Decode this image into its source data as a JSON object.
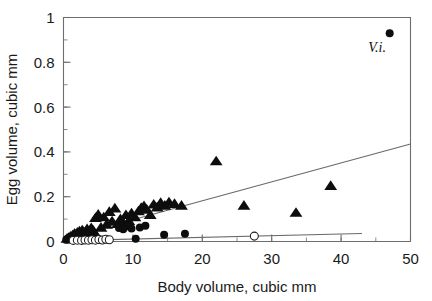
{
  "chart_data": {
    "type": "scatter",
    "title": "",
    "xlabel": "Body volume, cubic mm",
    "ylabel": "Egg volume, cubic mm",
    "xlim": [
      0,
      50
    ],
    "ylim": [
      0,
      1
    ],
    "xticks": [
      0,
      10,
      20,
      30,
      40,
      50
    ],
    "xtick_labels": [
      "0",
      "10",
      "20",
      "30",
      "40",
      "50"
    ],
    "xminor_step": 5,
    "yticks": [
      0,
      0.2,
      0.4,
      0.6,
      0.8,
      1
    ],
    "ytick_labels": [
      "0",
      "0.2",
      "0.4",
      "0.6",
      "0.8",
      "1"
    ],
    "yminor_step": 0.1,
    "grid": false,
    "legend": "none",
    "annotations": [
      {
        "text": "V.i.",
        "x": 45.2,
        "y": 0.845,
        "style": "italic-serif"
      }
    ],
    "series": [
      {
        "name": "filled-triangles",
        "marker": "filled-triangle",
        "color": "#0d0d0d",
        "points": [
          [
            0.5,
            0.012
          ],
          [
            0.7,
            0.016
          ],
          [
            0.9,
            0.01
          ],
          [
            1.0,
            0.022
          ],
          [
            1.1,
            0.014
          ],
          [
            1.3,
            0.028
          ],
          [
            1.5,
            0.02
          ],
          [
            1.6,
            0.035
          ],
          [
            1.8,
            0.026
          ],
          [
            2.0,
            0.04
          ],
          [
            2.1,
            0.03
          ],
          [
            2.3,
            0.045
          ],
          [
            2.5,
            0.034
          ],
          [
            2.7,
            0.05
          ],
          [
            2.9,
            0.042
          ],
          [
            3.1,
            0.03
          ],
          [
            3.4,
            0.055
          ],
          [
            3.7,
            0.044
          ],
          [
            4.0,
            0.06
          ],
          [
            4.3,
            0.048
          ],
          [
            4.6,
            0.105
          ],
          [
            5.0,
            0.12
          ],
          [
            5.4,
            0.062
          ],
          [
            5.8,
            0.108
          ],
          [
            6.2,
            0.075
          ],
          [
            6.6,
            0.132
          ],
          [
            7.0,
            0.09
          ],
          [
            7.4,
            0.148
          ],
          [
            7.8,
            0.078
          ],
          [
            8.2,
            0.1
          ],
          [
            8.6,
            0.084
          ],
          [
            9.0,
            0.118
          ],
          [
            9.4,
            0.092
          ],
          [
            9.8,
            0.126
          ],
          [
            10.3,
            0.108
          ],
          [
            10.8,
            0.135
          ],
          [
            11.2,
            0.15
          ],
          [
            11.6,
            0.158
          ],
          [
            12.0,
            0.142
          ],
          [
            12.5,
            0.118
          ],
          [
            13.0,
            0.165
          ],
          [
            13.5,
            0.152
          ],
          [
            14.0,
            0.172
          ],
          [
            14.6,
            0.16
          ],
          [
            15.2,
            0.175
          ],
          [
            16.0,
            0.168
          ],
          [
            17.0,
            0.16
          ],
          [
            22.0,
            0.358
          ],
          [
            26.0,
            0.16
          ],
          [
            33.5,
            0.128
          ],
          [
            38.5,
            0.248
          ]
        ]
      },
      {
        "name": "filled-circles",
        "marker": "filled-circle",
        "color": "#0d0d0d",
        "points": [
          [
            0.4,
            0.008
          ],
          [
            0.6,
            0.013
          ],
          [
            0.8,
            0.009
          ],
          [
            1.0,
            0.018
          ],
          [
            1.2,
            0.011
          ],
          [
            1.4,
            0.024
          ],
          [
            1.7,
            0.015
          ],
          [
            1.9,
            0.03
          ],
          [
            2.2,
            0.02
          ],
          [
            2.5,
            0.014
          ],
          [
            2.8,
            0.026
          ],
          [
            3.2,
            0.018
          ],
          [
            3.6,
            0.012
          ],
          [
            4.1,
            0.022
          ],
          [
            4.8,
            0.016
          ],
          [
            8.0,
            0.06
          ],
          [
            8.6,
            0.055
          ],
          [
            9.2,
            0.068
          ],
          [
            9.8,
            0.058
          ],
          [
            10.4,
            0.012
          ],
          [
            11.0,
            0.062
          ],
          [
            11.8,
            0.07
          ],
          [
            14.5,
            0.03
          ],
          [
            17.5,
            0.035
          ],
          [
            47.0,
            0.93
          ]
        ]
      },
      {
        "name": "open-circles",
        "marker": "open-circle",
        "color": "#ffffff",
        "points": [
          [
            1.4,
            0.005
          ],
          [
            2.0,
            0.006
          ],
          [
            2.6,
            0.005
          ],
          [
            3.1,
            0.007
          ],
          [
            3.6,
            0.006
          ],
          [
            4.1,
            0.008
          ],
          [
            4.6,
            0.006
          ],
          [
            5.1,
            0.009
          ],
          [
            5.6,
            0.007
          ],
          [
            6.1,
            0.01
          ],
          [
            6.6,
            0.008
          ],
          [
            27.5,
            0.024
          ]
        ]
      }
    ],
    "fit_lines": [
      {
        "name": "upper-regression-line",
        "x0": 0.6,
        "y0": 0.018,
        "x1": 50.0,
        "y1": 0.435,
        "color": "#6a6a6a"
      },
      {
        "name": "lower-regression-line",
        "x0": 0.6,
        "y0": 0.004,
        "x1": 43.0,
        "y1": 0.036,
        "color": "#6a6a6a"
      }
    ]
  }
}
